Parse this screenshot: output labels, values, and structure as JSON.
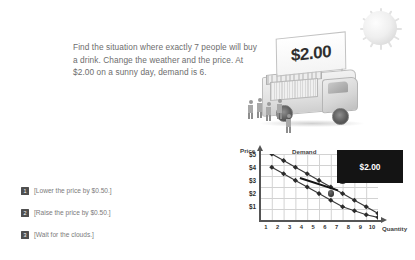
{
  "scene": {
    "sun_icon": "sun-icon",
    "truck": {
      "sign_price": "$2.00",
      "name": "food-truck"
    },
    "people_count": 5
  },
  "prompt": {
    "text": "Find the situation where exactly 7 people will buy a drink. Change the weather and the price. At $2.00 on a sunny day, demand is 6."
  },
  "choices": [
    {
      "badge": "1",
      "label": "[Lower the price by $0.50.]"
    },
    {
      "badge": "2",
      "label": "[Raise the price by $0.50.]"
    },
    {
      "badge": "3",
      "label": "[Wait for the clouds.]"
    }
  ],
  "callout": {
    "value": "$2.00"
  },
  "chart_data": {
    "type": "line",
    "title": "Demand",
    "xlabel": "Quantity",
    "ylabel": "Price",
    "grid": true,
    "legend": "none",
    "xlim": [
      0,
      10
    ],
    "ylim": [
      0,
      5
    ],
    "xticks": [
      "1",
      "2",
      "3",
      "4",
      "5",
      "6",
      "7",
      "8",
      "9",
      "10"
    ],
    "yticks": [
      "$1",
      "$2",
      "$3",
      "$4",
      "$5"
    ],
    "series": [
      {
        "name": "Sunny demand",
        "x": [
          1,
          2,
          3,
          4,
          5,
          6,
          7,
          8,
          9,
          10
        ],
        "y": [
          5.0,
          4.5,
          4.0,
          3.5,
          3.0,
          2.5,
          2.0,
          1.5,
          1.0,
          0.5
        ]
      },
      {
        "name": "Cloudy demand",
        "x": [
          1,
          2,
          3,
          4,
          5,
          6,
          7,
          8,
          9,
          10
        ],
        "y": [
          4.0,
          3.5,
          3.0,
          2.5,
          2.0,
          1.5,
          1.0,
          0.7,
          0.4,
          0.2
        ]
      }
    ],
    "highlights": [
      {
        "label": "current",
        "x": 6,
        "y": 2.0
      },
      {
        "label": "target",
        "x": 7,
        "y": 3.0
      }
    ]
  }
}
